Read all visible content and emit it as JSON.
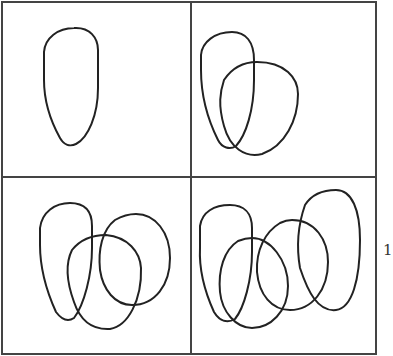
{
  "figure": {
    "grid": {
      "rows": 2,
      "cols": 2
    },
    "panels": [
      {
        "position": "top-left",
        "loop_count": 1
      },
      {
        "position": "top-right",
        "loop_count": 2
      },
      {
        "position": "bottom-left",
        "loop_count": 3
      },
      {
        "position": "bottom-right",
        "loop_count": 4
      }
    ],
    "stroke_color": "#222222",
    "frame_color": "#444444",
    "margin_glyph": "1"
  }
}
